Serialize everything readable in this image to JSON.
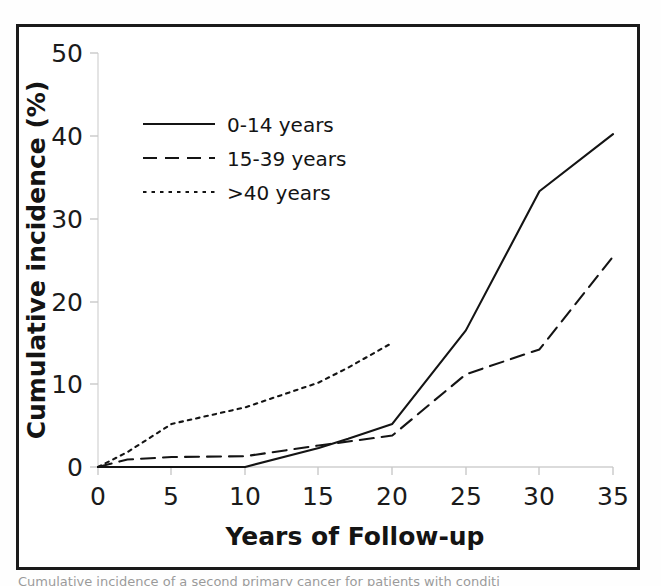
{
  "figure": {
    "caption_sliver": "Cumulative incidence of a second primary cancer for patients with conditi"
  },
  "chart_data": {
    "type": "line",
    "title": "",
    "xlabel": "Years of Follow-up",
    "ylabel": "Cumulative incidence (%)",
    "xlim": [
      0,
      35
    ],
    "ylim": [
      0,
      50
    ],
    "xticks": [
      0,
      5,
      10,
      15,
      20,
      25,
      30,
      35
    ],
    "yticks": [
      0,
      10,
      20,
      30,
      40,
      50
    ],
    "xtick_labels": [
      "0",
      "5",
      "10",
      "15",
      "20",
      "25",
      "30",
      "35"
    ],
    "ytick_labels": [
      "0",
      "10",
      "20",
      "30",
      "40",
      "50"
    ],
    "grid": false,
    "legend_position": "upper-left",
    "series": [
      {
        "name": "0-14 years",
        "style": "solid",
        "color": "#141414",
        "x": [
          0,
          5,
          10,
          15,
          17,
          20,
          25,
          30,
          35
        ],
        "values": [
          0,
          0,
          0,
          2.3,
          3.4,
          5.2,
          16.5,
          33.3,
          40.2
        ]
      },
      {
        "name": "15-39 years",
        "style": "dashed",
        "color": "#141414",
        "x": [
          0,
          2,
          5,
          10,
          15,
          20,
          25,
          30,
          35
        ],
        "values": [
          0,
          0.9,
          1.2,
          1.3,
          2.6,
          3.8,
          11.2,
          14.2,
          25.4
        ]
      },
      {
        "name": ">40 years",
        "style": "dotted",
        "color": "#141414",
        "x": [
          0,
          2,
          5,
          10,
          15,
          17,
          20
        ],
        "values": [
          0,
          1.8,
          5.2,
          7.2,
          10.2,
          12.0,
          15.0
        ]
      }
    ]
  },
  "legend": {
    "entries": [
      {
        "label": "0-14 years",
        "style": "solid"
      },
      {
        "label": "15-39 years",
        "style": "dashed"
      },
      {
        "label": ">40 years",
        "style": "dotted"
      }
    ]
  }
}
